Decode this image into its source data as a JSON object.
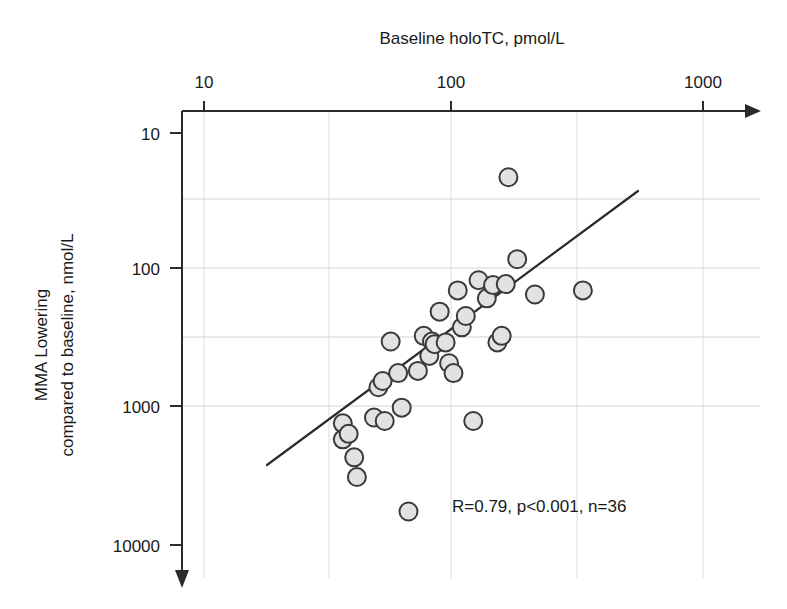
{
  "chart_data": {
    "type": "scatter",
    "title": "",
    "xlabel": "Baseline holoTC, pmol/L",
    "ylabel": "MMA Lowering compared to baseline, nmol/L",
    "ylabel_line1": "MMA Lowering",
    "ylabel_line2": "compared to baseline, nmol/L",
    "xscale": "log",
    "yscale": "log",
    "y_inverted": true,
    "xlim": [
      6.5,
      1600
    ],
    "ylim": [
      7.0,
      14000
    ],
    "xticks": [
      10,
      100,
      1000
    ],
    "xticklabels": [
      "10",
      "100",
      "1000"
    ],
    "yticks": [
      10,
      100,
      1000,
      10000
    ],
    "yticklabels": [
      "10",
      "100",
      "1000",
      "10000"
    ],
    "grid": true,
    "legend": null,
    "annotation": "R=0.79, p<0.001, n=36",
    "statistics": {
      "R": 0.79,
      "p": "<0.001",
      "n": 36
    },
    "marker": {
      "shape": "circle",
      "fill": "#e2e2e2",
      "edge": "#3a3a3a",
      "size_px": 18
    },
    "fit_line": {
      "label": "linear regression (log-log)",
      "x_start": 34,
      "y_start": 2400,
      "x_end": 430,
      "y_end": 42,
      "color": "#2b2b2b"
    },
    "points": [
      {
        "x": 36,
        "y": 1300
      },
      {
        "x": 36,
        "y": 1700
      },
      {
        "x": 38,
        "y": 1550
      },
      {
        "x": 40,
        "y": 2300
      },
      {
        "x": 41,
        "y": 3200
      },
      {
        "x": 48,
        "y": 1180
      },
      {
        "x": 50,
        "y": 710
      },
      {
        "x": 52,
        "y": 640
      },
      {
        "x": 53,
        "y": 1250
      },
      {
        "x": 56,
        "y": 330
      },
      {
        "x": 60,
        "y": 560
      },
      {
        "x": 62,
        "y": 1000
      },
      {
        "x": 66,
        "y": 5700
      },
      {
        "x": 72,
        "y": 540
      },
      {
        "x": 76,
        "y": 300
      },
      {
        "x": 80,
        "y": 420
      },
      {
        "x": 82,
        "y": 330
      },
      {
        "x": 84,
        "y": 345
      },
      {
        "x": 88,
        "y": 200
      },
      {
        "x": 93,
        "y": 335
      },
      {
        "x": 96,
        "y": 475
      },
      {
        "x": 100,
        "y": 560
      },
      {
        "x": 104,
        "y": 140
      },
      {
        "x": 108,
        "y": 260
      },
      {
        "x": 112,
        "y": 215
      },
      {
        "x": 120,
        "y": 1250
      },
      {
        "x": 126,
        "y": 118
      },
      {
        "x": 136,
        "y": 160
      },
      {
        "x": 144,
        "y": 128
      },
      {
        "x": 150,
        "y": 335
      },
      {
        "x": 156,
        "y": 300
      },
      {
        "x": 162,
        "y": 126
      },
      {
        "x": 166,
        "y": 21
      },
      {
        "x": 180,
        "y": 83
      },
      {
        "x": 212,
        "y": 150
      },
      {
        "x": 330,
        "y": 140
      }
    ]
  },
  "figure": {
    "background": "#ffffff",
    "axis_color": "#2b2b2b",
    "grid_color": "#dcdcdc"
  }
}
